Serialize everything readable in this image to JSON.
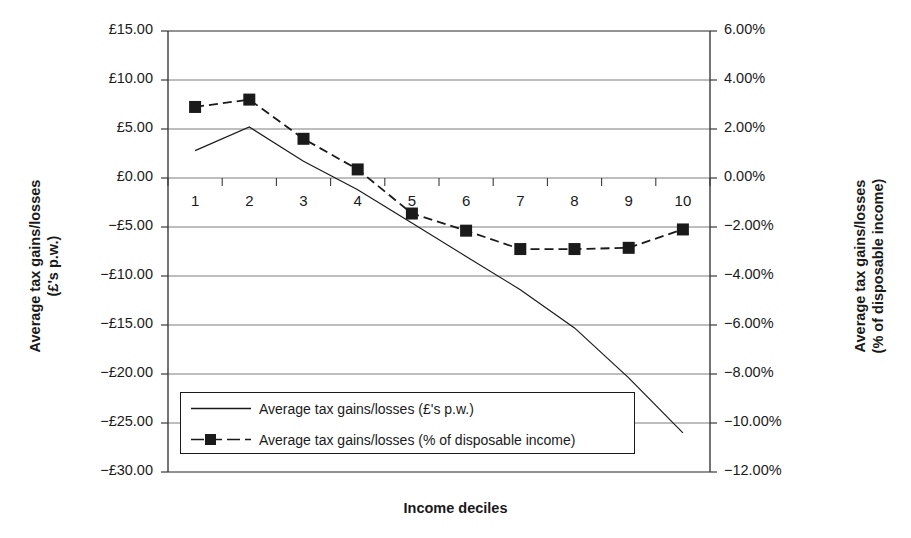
{
  "chart_data": {
    "type": "line",
    "title": "",
    "xlabel": "Income deciles",
    "ylabel_left_line1": "Average tax gains/losses",
    "ylabel_left_line2": "(£'s p.w.)",
    "ylabel_right_line1": "Average tax gains/losses",
    "ylabel_right_line2": "(% of disposable income)",
    "categories": [
      "1",
      "2",
      "3",
      "4",
      "5",
      "6",
      "7",
      "8",
      "9",
      "10"
    ],
    "grid": true,
    "legend_position": "inside-lower-left",
    "axis_left": {
      "label": "Average tax gains/losses (£'s p.w.)",
      "ylim": [
        -30,
        15
      ],
      "tick_step": 5,
      "ticks": [
        "£15.00",
        "£10.00",
        "£5.00",
        "£0.00",
        "−£5.00",
        "−£10.00",
        "−£15.00",
        "−£20.00",
        "−£25.00",
        "−£30.00"
      ],
      "tick_values": [
        15,
        10,
        5,
        0,
        -5,
        -10,
        -15,
        -20,
        -25,
        -30
      ]
    },
    "axis_right": {
      "label": "Average tax gains/losses (% of disposable income)",
      "ylim": [
        -12,
        6
      ],
      "tick_step": 2,
      "ticks": [
        "6.00%",
        "4.00%",
        "2.00%",
        "0.00%",
        "−2.00%",
        "−4.00%",
        "−6.00%",
        "−8.00%",
        "−10.00%",
        "−12.00%"
      ],
      "tick_values": [
        6,
        4,
        2,
        0,
        -2,
        -4,
        -6,
        -8,
        -10,
        -12
      ]
    },
    "series": [
      {
        "name": "Average tax gains/losses (£'s p.w.)",
        "axis": "left",
        "style": "solid",
        "marker": "none",
        "color": "#1a1a1a",
        "values": [
          2.8,
          5.2,
          1.7,
          -1.2,
          -4.6,
          -8.0,
          -11.4,
          -15.3,
          -20.4,
          -26.0
        ]
      },
      {
        "name": "Average tax gains/losses (% of disposable income)",
        "axis": "right",
        "style": "dashed",
        "marker": "square",
        "color": "#1a1a1a",
        "values": [
          2.9,
          3.2,
          1.6,
          0.35,
          -1.45,
          -2.15,
          -2.9,
          -2.9,
          -2.85,
          -2.1
        ]
      }
    ]
  },
  "legend": {
    "items": [
      {
        "label": "Average tax gains/losses (£'s p.w.)",
        "style": "solid",
        "marker": "none"
      },
      {
        "label": "Average tax gains/losses (% of disposable income)",
        "style": "dashed",
        "marker": "square"
      }
    ]
  }
}
